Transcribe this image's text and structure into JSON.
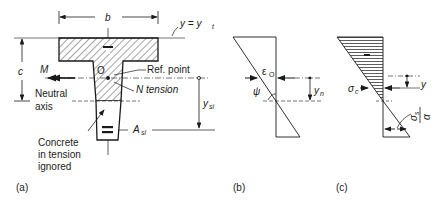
{
  "figure": {
    "panel_a": {
      "caption": "(a)",
      "width_label": "b",
      "top_fiber_label": "y = y",
      "top_fiber_sub": "t",
      "depth_label": "c",
      "moment_label": "M",
      "origin_label": "O",
      "ref_point_label": "Ref. point",
      "normal_force_label": "N tension",
      "neutral_axis_label": [
        "Neutral",
        "axis"
      ],
      "steel_distance_label": "y",
      "steel_distance_sub": "si",
      "steel_area_label": "A",
      "steel_area_sub": "si",
      "tension_note": [
        "Concrete",
        "in tension",
        "ignored"
      ],
      "compression_sign": "−",
      "steel_sign": "="
    },
    "panel_b": {
      "caption": "(b)",
      "strain_label": "ε",
      "strain_sub": "O",
      "curvature_label": "ψ",
      "na_depth_label": "y",
      "na_depth_sub": "n"
    },
    "panel_c": {
      "caption": "(c)",
      "concrete_stress_label": "σ",
      "concrete_stress_sub": "c",
      "compression_sign": "−",
      "y_label": "y",
      "steel_stress_num": "σ",
      "steel_stress_num_sub": "s",
      "steel_stress_den": "α"
    }
  },
  "colors": {
    "ink": "#1a1a1a",
    "background": "#ffffff"
  }
}
